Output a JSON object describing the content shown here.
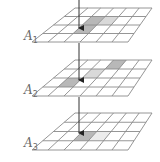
{
  "diagram": {
    "grid": {
      "cols": 6,
      "rows": 4,
      "line_color": "#8a8a8a",
      "fill": "#ffffff"
    },
    "colors": {
      "dark_cell": "#b8b8b8",
      "light_cell": "#d9d9d9",
      "arrow": "#333333",
      "label": "#6a6a6a"
    },
    "arrow_x": 79,
    "layers": [
      {
        "id": "A1",
        "label_main": "A",
        "label_sub": "1",
        "label_x": 4,
        "label_y": 40,
        "back": {
          "y": 8,
          "x0": 75,
          "x1": 152
        },
        "front": {
          "y": 42,
          "x0": 32,
          "x1": 128
        },
        "cells": [
          {
            "row": 1,
            "col": 2,
            "shade": "dark"
          },
          {
            "row": 1,
            "col": 3,
            "shade": "light"
          },
          {
            "row": 2,
            "col": 2,
            "shade": "dark"
          }
        ],
        "arrow": {
          "y0": 0,
          "y1": 28
        }
      },
      {
        "id": "A2",
        "label_main": "A",
        "label_sub": "2",
        "label_x": 4,
        "label_y": 94,
        "back": {
          "y": 60,
          "x0": 75,
          "x1": 152
        },
        "front": {
          "y": 96,
          "x0": 32,
          "x1": 128
        },
        "cells": [
          {
            "row": 0,
            "col": 3,
            "shade": "dark"
          },
          {
            "row": 1,
            "col": 2,
            "shade": "light"
          },
          {
            "row": 2,
            "col": 1,
            "shade": "dark"
          }
        ],
        "arrow": {
          "y0": 43,
          "y1": 80
        }
      },
      {
        "id": "A3",
        "label_main": "A",
        "label_sub": "3",
        "label_x": 4,
        "label_y": 147,
        "back": {
          "y": 113,
          "x0": 75,
          "x1": 152
        },
        "front": {
          "y": 150,
          "x0": 32,
          "x1": 128
        },
        "cells": [
          {
            "row": 2,
            "col": 2,
            "shade": "dark"
          },
          {
            "row": 2,
            "col": 3,
            "shade": "faint"
          }
        ],
        "arrow": {
          "y0": 97,
          "y1": 133
        }
      }
    ]
  }
}
